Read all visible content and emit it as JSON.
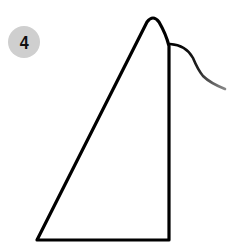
{
  "step": {
    "number": "4",
    "badge_color": "#cfcfcf",
    "number_color": "#111111"
  },
  "drawing": {
    "stroke_color": "#000000",
    "tail_fade_color": "#777777",
    "shape": "triangle-with-curved-tail"
  }
}
